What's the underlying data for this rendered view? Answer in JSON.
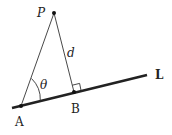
{
  "diagram": {
    "points": {
      "P": {
        "label": "P",
        "x": 54,
        "y": 13
      },
      "A": {
        "label": "A",
        "x": 21,
        "y": 106
      },
      "B": {
        "label": "B",
        "x": 74,
        "y": 92
      }
    },
    "line": {
      "label": "L",
      "x1": 12,
      "y1": 108,
      "x2": 147,
      "y2": 75
    },
    "segments": [
      {
        "from": "P",
        "to": "A"
      },
      {
        "from": "P",
        "to": "B",
        "label": "d"
      }
    ],
    "angle": {
      "vertex": "A",
      "label": "θ"
    },
    "right_angle_at": "B",
    "labels": {
      "P": "P",
      "A": "A",
      "B": "B",
      "L": "L",
      "d": "d",
      "theta": "θ"
    },
    "colors": {
      "stroke": "#222222",
      "background": "#ffffff"
    }
  }
}
